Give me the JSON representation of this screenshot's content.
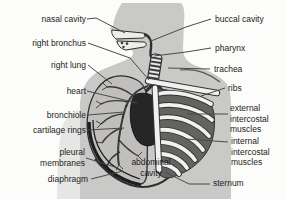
{
  "diagram": {
    "labels_left": [
      "nasal cavity",
      "right bronchus",
      "right lung",
      "heart",
      "bronchiole",
      "cartilage rings",
      "pleural membranes",
      "diaphragm"
    ],
    "labels_right": [
      "buccal cavity",
      "pharynx",
      "trachea",
      "ribs",
      "external intercostal muscles",
      "internal intercostal muscles",
      "sternum"
    ],
    "label_center": "abdominal cavity"
  },
  "colors": {
    "background": "#fcfcfa",
    "silhouette": "#c9c9c8",
    "arm_shade": "#e2e2e0",
    "lung": "#c0bfbd",
    "heart": "#262626",
    "intercostal_space": "#636362",
    "bone": "#f1f1ef",
    "outline": "#2e2e2e",
    "leader_line": "#4a4a4a",
    "label_text": "#1c1c1c"
  }
}
